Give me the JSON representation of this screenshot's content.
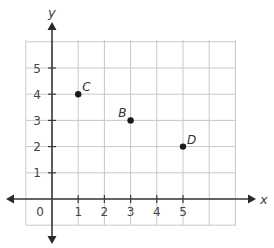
{
  "chart_data": {
    "type": "scatter",
    "title": "",
    "xlabel": "x",
    "ylabel": "y",
    "xlim": [
      -1,
      7
    ],
    "ylim": [
      -1,
      6
    ],
    "grid": true,
    "x_ticks": [
      1,
      2,
      3,
      4,
      5
    ],
    "y_ticks": [
      1,
      2,
      3,
      4,
      5
    ],
    "origin_label": "0",
    "points": [
      {
        "label": "C",
        "x": 1,
        "y": 4
      },
      {
        "label": "B",
        "x": 3,
        "y": 3
      },
      {
        "label": "D",
        "x": 5,
        "y": 2
      }
    ]
  }
}
